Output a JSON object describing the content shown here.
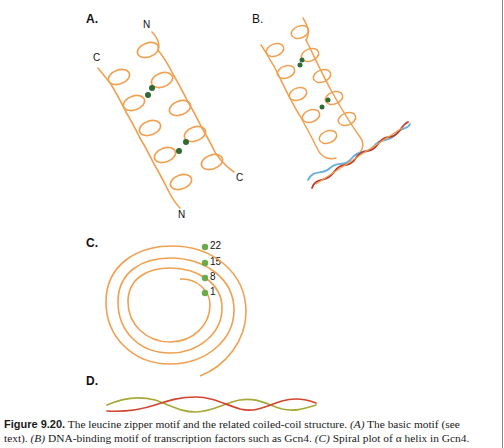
{
  "figure": {
    "panels": {
      "A": {
        "label": "A.",
        "termini": {
          "top": "N",
          "left": "C",
          "right": "C",
          "bottom": "N"
        }
      },
      "B": {
        "label": "B."
      },
      "C": {
        "label": "C.",
        "residues": [
          "22",
          "15",
          "8",
          "1"
        ]
      },
      "D": {
        "label": "D."
      }
    },
    "colors": {
      "helix": "#F0A050",
      "leucine": "#2E6B35",
      "spiral_dot": "#6BAA4A",
      "dna_strand_1": "#C0392B",
      "dna_strand_2": "#6AAEDD",
      "coil_strand_1": "#D2452F",
      "coil_strand_2": "#A8A83A"
    },
    "caption": {
      "figure_number": "Figure 9.20.",
      "line1_rest": " The leucine zipper motif and the related coiled-coil structure. ",
      "a_ref": "(A)",
      "line1_end": " The basic motif (see",
      "line2_start": "text). ",
      "b_ref": "(B)",
      "line2_mid": " DNA-binding motif of transcription factors such as Gcn4. ",
      "c_ref": "(C)",
      "line2_end": " Spiral plot of α helix in Gcn4."
    }
  }
}
